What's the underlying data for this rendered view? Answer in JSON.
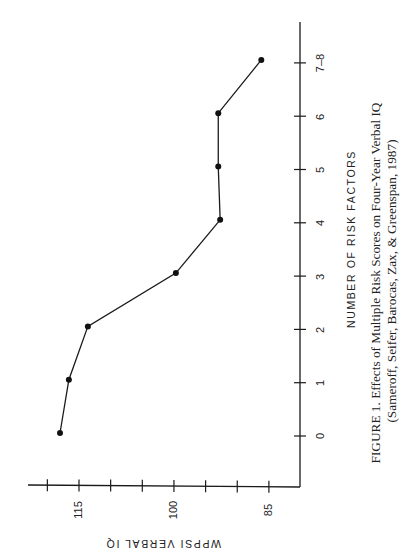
{
  "chart_data": {
    "type": "line",
    "orientation": "rotated-90-ccw",
    "title": "FIGURE 1. Effects of Multiple Risk Scores on Four-Year Verbal IQ",
    "subtitle": "(Sameroff, Seifer, Barocas, Zax, & Greenspan, 1987)",
    "xlabel": "NUMBER OF RISK FACTORS",
    "ylabel": "WPPSI VERBAL IQ",
    "categories": [
      "0",
      "1",
      "2",
      "3",
      "4",
      "5",
      "6",
      "7–8"
    ],
    "values": [
      118.0,
      116.6,
      113.6,
      99.7,
      92.7,
      93.0,
      93.0,
      86.2
    ],
    "series": [
      {
        "name": "WPPSI Verbal IQ",
        "values": [
          118.0,
          116.6,
          113.6,
          99.7,
          92.7,
          93.0,
          93.0,
          86.2
        ]
      }
    ],
    "ylim": [
      82,
      122
    ],
    "y_ticks": [
      120,
      115,
      110,
      105,
      100,
      95,
      90,
      85
    ],
    "y_tick_labels": [
      "115",
      "100",
      "85"
    ],
    "grid": false,
    "legend": "none",
    "markers": "filled-circle"
  },
  "figure": {
    "x_axis_title": "NUMBER OF RISK FACTORS",
    "y_axis_title": "WPPSI VERBAL IQ",
    "caption_line1": "FIGURE 1. Effects of Multiple Risk Scores on Four-Year Verbal IQ",
    "caption_line2": "(Sameroff, Seifer, Barocas, Zax, & Greenspan, 1987)",
    "y_tick_labels": {
      "t115": "115",
      "t100": "100",
      "t85": "85"
    },
    "x_tick_labels": {
      "t0": "0",
      "t1": "1",
      "t2": "2",
      "t3": "3",
      "t4": "4",
      "t5": "5",
      "t6": "6",
      "t78": "7–8"
    }
  }
}
